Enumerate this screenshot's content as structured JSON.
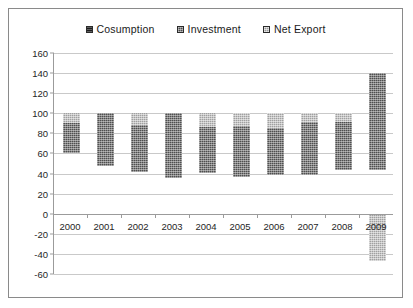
{
  "chart_data": {
    "type": "bar",
    "stacked": true,
    "title": "",
    "subtitle": "",
    "xlabel": "",
    "ylabel": "",
    "categories": [
      "2000",
      "2001",
      "2002",
      "2003",
      "2004",
      "2005",
      "2006",
      "2007",
      "2008",
      "2009"
    ],
    "series": [
      {
        "name": "Cosumption",
        "color": "#151515",
        "values": [
          60,
          48,
          42,
          36,
          41,
          37,
          39,
          39,
          44,
          44
        ]
      },
      {
        "name": "Investment",
        "color": "#4f4f4f",
        "values": [
          30,
          52,
          46,
          64,
          45,
          50,
          46,
          52,
          47,
          96
        ]
      },
      {
        "name": "Net Export",
        "color": "#a0a0a0",
        "values": [
          10,
          0,
          12,
          0,
          14,
          13,
          15,
          9,
          9,
          -47
        ]
      }
    ],
    "ylim": [
      -60,
      160
    ],
    "ytick_step": 20,
    "yticks": [
      160,
      140,
      120,
      100,
      80,
      60,
      40,
      20,
      0,
      -20,
      -40,
      -60
    ],
    "grid": true,
    "legend_position": "top-center",
    "legend": [
      "Cosumption",
      "Investment",
      "Net Export"
    ],
    "annotations": []
  },
  "legend": {
    "items": [
      {
        "label": "Cosumption",
        "swatch": "square-dark-icon"
      },
      {
        "label": "Investment",
        "swatch": "square-mid-icon"
      },
      {
        "label": "Net Export",
        "swatch": "square-light-icon"
      }
    ]
  }
}
